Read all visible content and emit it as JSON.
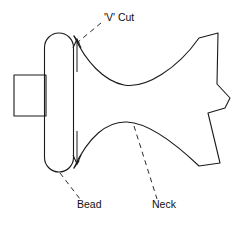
{
  "diagram": {
    "background_color": "#ffffff",
    "line_color": "#1a1a1a",
    "leader_color": "#2b2b2b",
    "annotations": [
      {
        "id": "v-cut",
        "label": "'V' Cut",
        "text_x": 104,
        "text_y": 21,
        "leader": "M 101,23 L 78,42",
        "anchor": "start"
      },
      {
        "id": "bead",
        "label": "Bead",
        "text_x": 77,
        "text_y": 208,
        "leader": "M 60,173 L 80,199",
        "anchor": "start"
      },
      {
        "id": "neck",
        "label": "Neck",
        "text_x": 152,
        "text_y": 208,
        "leader": "M 134,126 L 157,199",
        "anchor": "start"
      }
    ],
    "shapes": {
      "shaft_rect": "M 14,75 L 46,75 L 46,116 L 14,116 Z",
      "bead_stadium": "M 59,33 L 59,33 A 14.5,14.5 0 0 0 44.5,47.5 L 44.5,157.5 A 14.5,14.5 0 0 0 59,172 L 59,172 A 14.5,14.5 0 0 0 73.5,157.5 L 73.5,47.5 A 14.5,14.5 0 0 0 59,33 Z",
      "body_outline": "M 74,36 C 86,62 104,81 124,85 C 146,89 178,68 199,38 L 218,33 L 217,84 L 230,98 L 225,108 L 208,113 L 220,163 L 199,166 C 178,146 150,123 127,122 C 107,121 88,137 74,168",
      "v_cut_top_edge": "M 74,36 L 79,43",
      "v_cut_bottom_edge": "M 74,168 L 79,161"
    },
    "dimension_arrows": [
      {
        "id": "v-cut-upper-arrow",
        "shaft": "M 77,72 L 77,40",
        "head": "M 73,48 L 77,39 L 81,48"
      },
      {
        "id": "v-cut-lower-arrow",
        "shaft": "M 77,131 L 77,163",
        "head": "M 73,155 L 77,164 L 81,155"
      }
    ]
  }
}
